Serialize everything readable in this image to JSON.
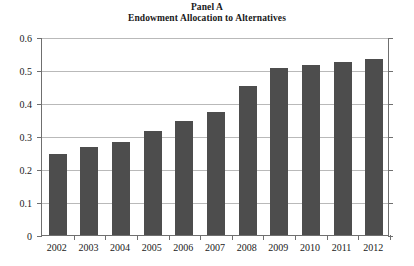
{
  "chart_data": {
    "type": "bar",
    "title": "Panel A",
    "subtitle": "Endowment Allocation to Alternatives",
    "xlabel": "",
    "ylabel": "",
    "categories": [
      "2002",
      "2003",
      "2004",
      "2005",
      "2006",
      "2007",
      "2008",
      "2009",
      "2010",
      "2011",
      "2012"
    ],
    "values": [
      0.245,
      0.267,
      0.283,
      0.315,
      0.345,
      0.372,
      0.452,
      0.506,
      0.516,
      0.525,
      0.534
    ],
    "ylim": [
      0,
      0.6
    ],
    "ytick_labels": [
      "0",
      "0.1",
      "0.2",
      "0.3",
      "0.4",
      "0.5",
      "0.6"
    ],
    "ytick_values": [
      0,
      0.1,
      0.2,
      0.3,
      0.4,
      0.5,
      0.6
    ],
    "grid": true,
    "legend": "none",
    "bar_color": "#4d4d4d",
    "gridline_color": "#b9b9b9",
    "axis_color": "#6f6f6f",
    "background_color": "#ffffff"
  }
}
